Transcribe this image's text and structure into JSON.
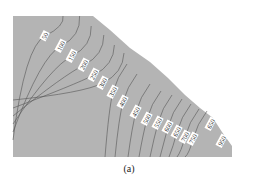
{
  "chart_data": {
    "type": "contour",
    "title": "",
    "caption": "(a)",
    "region_color": "#b4b4b4",
    "line_color": "#555555",
    "region_polygon": [
      [
        13,
        16
      ],
      [
        93,
        16
      ],
      [
        110,
        30
      ],
      [
        130,
        48
      ],
      [
        150,
        62
      ],
      [
        168,
        78
      ],
      [
        185,
        95
      ],
      [
        200,
        108
      ],
      [
        213,
        118
      ],
      [
        222,
        132
      ],
      [
        232,
        146
      ],
      [
        232,
        157
      ],
      [
        13,
        157
      ]
    ],
    "contour_levels": [
      50,
      100,
      150,
      200,
      250,
      300,
      350,
      400,
      450,
      500,
      550,
      600,
      650,
      700,
      750,
      650,
      950
    ],
    "labels": [
      {
        "text": "50",
        "x": 45,
        "y": 36
      },
      {
        "text": "100",
        "x": 61,
        "y": 46
      },
      {
        "text": "150",
        "x": 72,
        "y": 56
      },
      {
        "text": "200",
        "x": 84,
        "y": 65
      },
      {
        "text": "250",
        "x": 94,
        "y": 75
      },
      {
        "text": "300",
        "x": 103,
        "y": 83
      },
      {
        "text": "350",
        "x": 113,
        "y": 92
      },
      {
        "text": "400",
        "x": 123,
        "y": 102
      },
      {
        "text": "450",
        "x": 136,
        "y": 112
      },
      {
        "text": "500",
        "x": 147,
        "y": 119
      },
      {
        "text": "550",
        "x": 158,
        "y": 123
      },
      {
        "text": "600",
        "x": 168,
        "y": 127
      },
      {
        "text": "650",
        "x": 177,
        "y": 132
      },
      {
        "text": "700",
        "x": 185,
        "y": 137
      },
      {
        "text": "750",
        "x": 193,
        "y": 139
      },
      {
        "text": "650",
        "x": 211,
        "y": 124
      },
      {
        "text": "950",
        "x": 222,
        "y": 141
      }
    ],
    "xlabel": "",
    "ylabel": "",
    "grid": false
  }
}
